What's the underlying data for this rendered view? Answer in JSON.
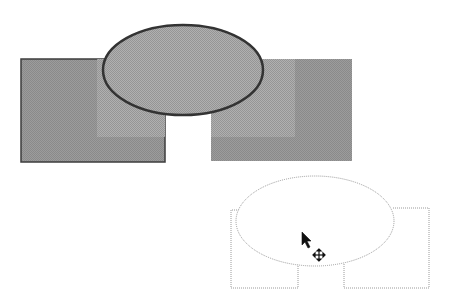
{
  "canvas": {
    "width": 453,
    "height": 305,
    "background": "#ffffff"
  },
  "original_group": {
    "label": "grouped-shapes",
    "colors": {
      "dark_fill": "#8f8f8f",
      "light_fill": "#a3a3a3",
      "ellipse_fill": "#9a9a9a",
      "border": "#3c3c3c"
    },
    "left_rect": {
      "x": 21,
      "y": 59,
      "w": 144,
      "h": 103
    },
    "right_rect": {
      "x": 211,
      "y": 59,
      "w": 141,
      "h": 102
    },
    "ellipse": {
      "cx": 183,
      "cy": 70,
      "rx": 80,
      "ry": 45
    }
  },
  "drag_outline": {
    "label": "move-preview-outline",
    "color": "#9a9a9a",
    "left_rect": {
      "x": 231,
      "y": 210,
      "w": 67,
      "h": 78
    },
    "right_rect": {
      "x": 344,
      "y": 208,
      "w": 85,
      "h": 80
    },
    "ellipse": {
      "cx": 315,
      "cy": 221,
      "rx": 79,
      "ry": 45
    }
  },
  "cursor": {
    "type": "move-cursor",
    "x": 302,
    "y": 232
  }
}
